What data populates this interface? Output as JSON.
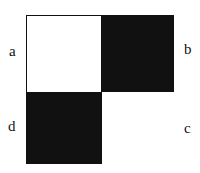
{
  "diagram": {
    "type": "2x2 checkerboard square",
    "cells": [
      {
        "position": "top-left",
        "label": "a",
        "fill": "#ffffff"
      },
      {
        "position": "top-right",
        "label": "b",
        "fill": "#111111"
      },
      {
        "position": "bottom-right",
        "label": "c",
        "fill": "#ffffff"
      },
      {
        "position": "bottom-left",
        "label": "d",
        "fill": "#111111"
      }
    ],
    "labels": {
      "a": "a",
      "b": "b",
      "c": "c",
      "d": "d"
    }
  }
}
